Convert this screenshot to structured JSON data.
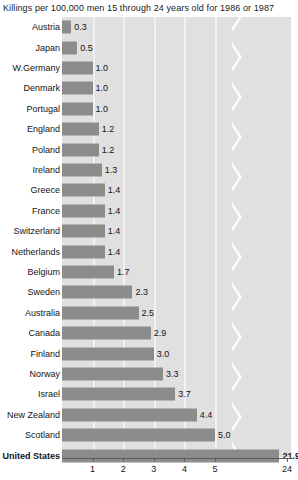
{
  "chart_data": {
    "type": "bar",
    "orientation": "horizontal",
    "title": "Killings per 100,000 men 15 through 24 years old for 1986 or 1987",
    "xlabel": "",
    "ylabel": "",
    "xlim": [
      0,
      24
    ],
    "grid": true,
    "legend": null,
    "axis_break": {
      "present": true,
      "style": "zigzag",
      "between": [
        5.6,
        23.0
      ],
      "note": "white zigzag line indicating a broken x-axis between 5 and 24"
    },
    "xticks": [
      {
        "label": "1",
        "value": 1
      },
      {
        "label": "2",
        "value": 2
      },
      {
        "label": "3",
        "value": 3
      },
      {
        "label": "4",
        "value": 4
      },
      {
        "label": "5",
        "value": 5
      },
      {
        "label": "24",
        "value": 24
      }
    ],
    "categories": [
      "Austria",
      "Japan",
      "W.Germany",
      "Denmark",
      "Portugal",
      "England",
      "Poland",
      "Ireland",
      "Greece",
      "France",
      "Switzerland",
      "Netherlands",
      "Belgium",
      "Sweden",
      "Australia",
      "Canada",
      "Finland",
      "Norway",
      "Israel",
      "New Zealand",
      "Scotland",
      "United States"
    ],
    "values": [
      0.3,
      0.5,
      1.0,
      1.0,
      1.0,
      1.2,
      1.2,
      1.3,
      1.4,
      1.4,
      1.4,
      1.4,
      1.7,
      2.3,
      2.5,
      2.9,
      3.0,
      3.3,
      3.7,
      4.4,
      5.0,
      21.9
    ],
    "value_labels": [
      "0.3",
      "0.5",
      "1.0",
      "1.0",
      "1.0",
      "1.2",
      "1.2",
      "1.3",
      "1.4",
      "1.4",
      "1.4",
      "1.4",
      "1.7",
      "2.3",
      "2.5",
      "2.9",
      "3.0",
      "3.3",
      "3.7",
      "4.4",
      "5.0",
      "21.9"
    ],
    "highlight_category": "United States",
    "colors": {
      "bar": "#8c8c8c",
      "plot_background": "#e0e0e0",
      "gridline": "#f2f2f2",
      "axis": "#5a5a5a",
      "text": "#141414",
      "page_background": "#ffffff"
    }
  }
}
